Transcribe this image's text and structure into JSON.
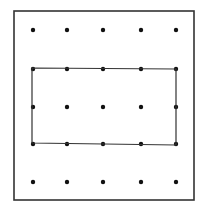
{
  "diagram": {
    "type": "geoboard",
    "frame": {
      "x1": 14,
      "y1": 11,
      "x2": 194,
      "y2": 200,
      "stroke": "#333333",
      "stroke_width": 1.6
    },
    "grid": {
      "columns": 5,
      "rows": 5,
      "x_positions": [
        33,
        67,
        103,
        141,
        176
      ],
      "y_positions": [
        30,
        69,
        107,
        144,
        182
      ],
      "dot_radius": 2.2,
      "dot_color": "#111111"
    },
    "rectangle": {
      "from": {
        "col": 1,
        "row": 2
      },
      "to": {
        "col": 5,
        "row": 4
      },
      "corners": [
        [
          32,
          68
        ],
        [
          176,
          69
        ],
        [
          176,
          145
        ],
        [
          32,
          143
        ]
      ],
      "stroke": "#333333",
      "stroke_width": 1.2,
      "width_units": 4,
      "height_units": 2
    }
  }
}
